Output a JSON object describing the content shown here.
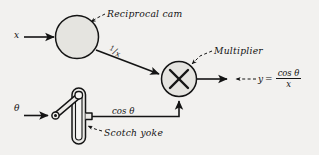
{
  "diagram": {
    "background_color": "#f2f1ef",
    "ink_color": "#141414",
    "component_fill": "#e3e2de"
  },
  "inputs": [
    {
      "id": "x",
      "label": "x",
      "description": "input variable x into reciprocal cam"
    },
    {
      "id": "theta",
      "label": "θ",
      "description": "input angle theta into scotch yoke crank"
    }
  ],
  "components": [
    {
      "id": "reciprocal-cam",
      "annotation_label": "Reciprocal cam",
      "shape": "circle",
      "glyph": ""
    },
    {
      "id": "multiplier",
      "annotation_label": "Multiplier",
      "shape": "circle",
      "glyph": "×"
    },
    {
      "id": "scotch-yoke",
      "annotation_label": "Scotch yoke",
      "shape": "slotted-yoke-with-crank",
      "glyph": ""
    }
  ],
  "signals": [
    {
      "id": "one-over-x",
      "numerator": "1",
      "slash": "/",
      "denominator": "x",
      "from": "reciprocal-cam",
      "to": "multiplier"
    },
    {
      "id": "cos-theta",
      "label": "cos θ",
      "from": "scotch-yoke",
      "to": "multiplier"
    }
  ],
  "output": {
    "id": "y-output",
    "lhs": "y",
    "equals": "=",
    "numerator": "cos θ",
    "denominator": "x",
    "full_text": "y = cos θ / x"
  }
}
